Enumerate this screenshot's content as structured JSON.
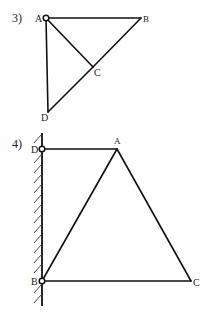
{
  "figures": [
    {
      "number_label": "3)",
      "points": {
        "A": {
          "label": "A",
          "x": 46,
          "y": 18,
          "pinned": true
        },
        "B": {
          "label": "B",
          "x": 141,
          "y": 18
        },
        "C": {
          "label": "C",
          "x": 93,
          "y": 67
        },
        "D": {
          "label": "D",
          "x": 48,
          "y": 112
        }
      },
      "bars": [
        [
          "A",
          "B"
        ],
        [
          "A",
          "C"
        ],
        [
          "A",
          "D"
        ],
        [
          "B",
          "C"
        ],
        [
          "C",
          "D"
        ]
      ]
    },
    {
      "number_label": "4)",
      "wall": {
        "x": 42,
        "y_top": 133,
        "y_bottom": 306,
        "hatch_side": "left"
      },
      "points": {
        "D": {
          "label": "D",
          "x": 42,
          "y": 149,
          "pinned": true
        },
        "A": {
          "label": "A",
          "x": 117,
          "y": 149
        },
        "B": {
          "label": "B",
          "x": 42,
          "y": 281,
          "pinned": true
        },
        "C": {
          "label": "C",
          "x": 191,
          "y": 281
        }
      },
      "bars": [
        [
          "D",
          "A"
        ],
        [
          "A",
          "B"
        ],
        [
          "A",
          "C"
        ],
        [
          "B",
          "C"
        ]
      ]
    }
  ]
}
